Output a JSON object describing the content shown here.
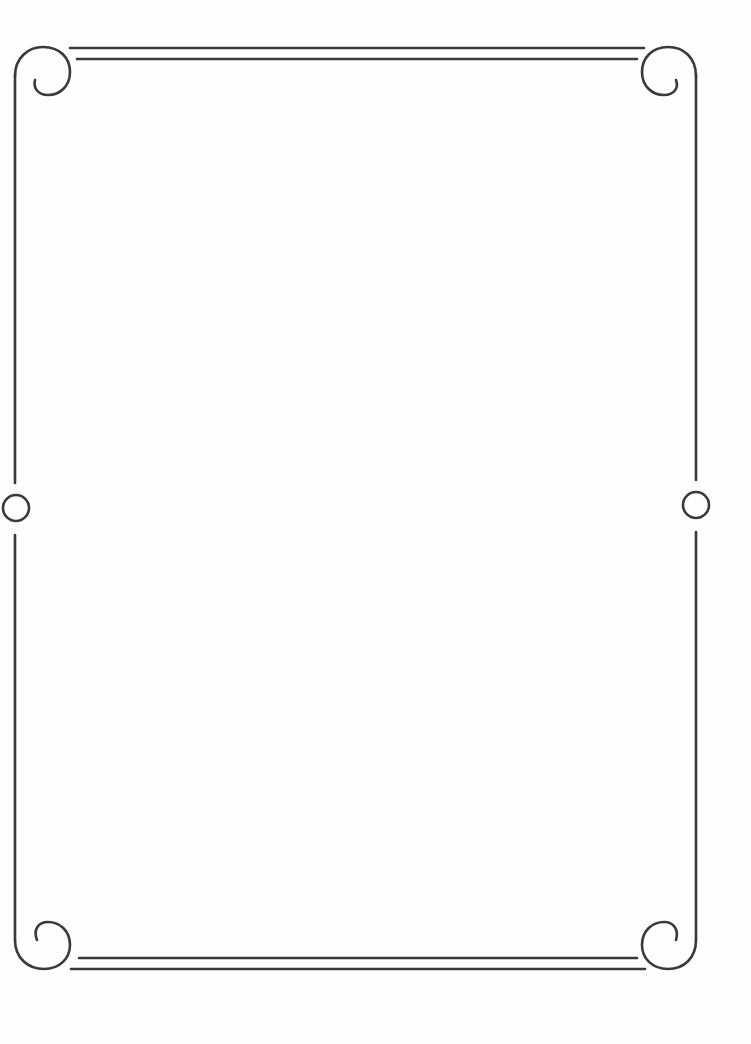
{
  "page": {
    "type": "decorative-border-page",
    "background_color": "#ffffff",
    "frame_color": "#3a3a3a",
    "content_text": ""
  },
  "frame": {
    "corners": [
      "top-left-spiral",
      "top-right-spiral",
      "bottom-left-spiral",
      "bottom-right-spiral"
    ],
    "side_ornaments": [
      "left-ring",
      "right-ring"
    ],
    "edge_lines": {
      "top": "double-line",
      "bottom": "double-line",
      "left": "single-line",
      "right": "single-line"
    }
  }
}
